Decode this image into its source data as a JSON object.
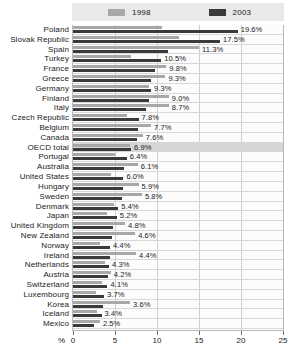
{
  "legend": {
    "items": [
      {
        "label": "1998",
        "color": "#a8a8a8"
      },
      {
        "label": "2003",
        "color": "#3a3a3a"
      }
    ]
  },
  "axis": {
    "unit_label": "%",
    "ticks": [
      "0",
      "5",
      "10",
      "15",
      "20",
      "25"
    ]
  },
  "chart_data": {
    "type": "bar",
    "title": "",
    "subtitle": "",
    "xlabel": "%",
    "ylabel": "",
    "xlim": [
      0,
      25
    ],
    "grid": true,
    "legend_position": "top",
    "orientation": "horizontal",
    "categories": [
      "Poland",
      "Slovak Republic",
      "Spain",
      "Turkey",
      "France",
      "Greece",
      "Germany",
      "Finland",
      "Italy",
      "Czech Republic",
      "Belgium",
      "Canada",
      "OECD total",
      "Portugal",
      "Australia",
      "United States",
      "Hungary",
      "Sweden",
      "Denmark",
      "Japan",
      "United Kingdom",
      "New Zealand",
      "Norway",
      "Ireland",
      "Netherlands",
      "Austria",
      "Switzerland",
      "Luxembourg",
      "Korea",
      "Iceland",
      "Mexico"
    ],
    "series": [
      {
        "name": "1998",
        "color": "#a8a8a8",
        "values": [
          10.6,
          12.6,
          15.0,
          6.9,
          11.1,
          11.0,
          9.1,
          11.4,
          11.4,
          6.4,
          9.3,
          8.3,
          6.8,
          5.0,
          7.7,
          4.5,
          7.8,
          8.2,
          4.9,
          4.1,
          6.2,
          7.4,
          3.2,
          7.5,
          3.8,
          4.5,
          3.5,
          2.7,
          6.8,
          2.8,
          3.2
        ]
      },
      {
        "name": "2003",
        "color": "#3a3a3a",
        "values": [
          19.6,
          17.5,
          11.3,
          10.5,
          9.8,
          9.3,
          9.3,
          9.0,
          8.7,
          7.8,
          7.7,
          7.6,
          6.9,
          6.4,
          6.1,
          6.0,
          5.9,
          5.8,
          5.4,
          5.2,
          4.8,
          4.6,
          4.4,
          4.4,
          4.3,
          4.2,
          4.1,
          3.7,
          3.6,
          3.4,
          2.5
        ]
      }
    ],
    "value_labels": [
      "19.6%",
      "17.5%",
      "11.3%",
      "10.5%",
      "9.8%",
      "9.3%",
      "9.3%",
      "9.0%",
      "8.7%",
      "7.8%",
      "7.7%",
      "7.6%",
      "6.9%",
      "6.4%",
      "6.1%",
      "6.0%",
      "5.9%",
      "5.8%",
      "5.4%",
      "5.2%",
      "4.8%",
      "4.6%",
      "4.4%",
      "4.4%",
      "4.3%",
      "4.2%",
      "4.1%",
      "3.7%",
      "3.6%",
      "3.4%",
      "2.5%"
    ],
    "highlighted_category": "OECD total"
  }
}
